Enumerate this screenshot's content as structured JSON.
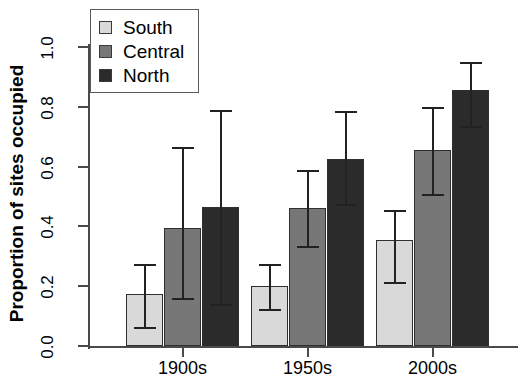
{
  "chart_data": {
    "type": "bar",
    "title": "",
    "xlabel": "",
    "ylabel": "Proportion of sites occupied",
    "categories": [
      "1900s",
      "1950s",
      "2000s"
    ],
    "ylim": [
      0.0,
      1.0
    ],
    "ytick_labels": [
      "0.0",
      "0.2",
      "0.4",
      "0.6",
      "0.8",
      "1.0"
    ],
    "ytick_values": [
      0.0,
      0.2,
      0.4,
      0.6,
      0.8,
      1.0
    ],
    "grid": false,
    "legend_position": "top-left",
    "series": [
      {
        "name": "South",
        "color": "#d9d9d9",
        "values": [
          0.175,
          0.2,
          0.355
        ],
        "error_low": [
          0.065,
          0.125,
          0.215
        ],
        "error_high": [
          0.275,
          0.275,
          0.455
        ]
      },
      {
        "name": "Central",
        "color": "#777777",
        "values": [
          0.395,
          0.46,
          0.655
        ],
        "error_low": [
          0.16,
          0.335,
          0.51
        ],
        "error_high": [
          0.665,
          0.59,
          0.8
        ]
      },
      {
        "name": "North",
        "color": "#2b2b2b",
        "values": [
          0.465,
          0.625,
          0.855
        ],
        "error_low": [
          0.14,
          0.475,
          0.735
        ],
        "error_high": [
          0.79,
          0.785,
          0.95
        ]
      }
    ]
  },
  "legend": {
    "entries": [
      {
        "label": "South"
      },
      {
        "label": "Central"
      },
      {
        "label": "North"
      }
    ]
  }
}
